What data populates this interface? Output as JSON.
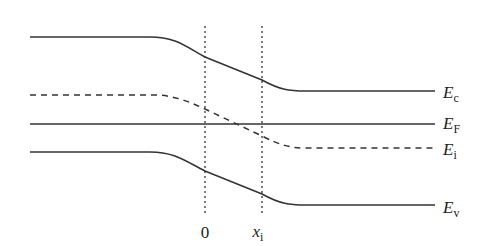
{
  "diagram": {
    "colors": {
      "line": "#333333",
      "background": "#ffffff"
    },
    "bands": [
      {
        "id": "Ec",
        "symbol": "E",
        "subscript": "c",
        "style": "solid",
        "left_y": 37,
        "right_y": 91
      },
      {
        "id": "EF",
        "symbol": "E",
        "subscript": "F",
        "style": "solid",
        "left_y": 124,
        "right_y": 124
      },
      {
        "id": "Ei",
        "symbol": "E",
        "subscript": "i",
        "style": "dashed",
        "left_y": 95,
        "right_y": 148
      },
      {
        "id": "Ev",
        "symbol": "E",
        "subscript": "v",
        "style": "solid",
        "left_y": 152,
        "right_y": 205
      }
    ],
    "markers": [
      {
        "id": "origin",
        "label": "0",
        "x": 205,
        "style": "dotted"
      },
      {
        "id": "xi",
        "symbol": "x",
        "subscript": "i",
        "x": 262,
        "style": "dotted"
      }
    ]
  }
}
